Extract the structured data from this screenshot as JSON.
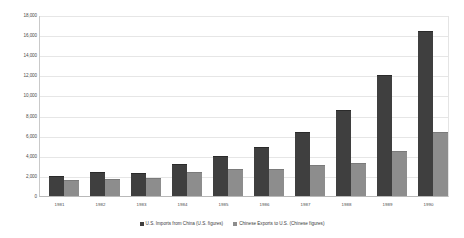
{
  "chart_data": {
    "type": "bar",
    "title": "",
    "subtitle": "",
    "xlabel": "",
    "ylabel": "",
    "ylim": [
      0,
      18000
    ],
    "ytick_step": 2000,
    "grid": true,
    "legend_position": "bottom",
    "categories": [
      "1981",
      "1982",
      "1983",
      "1984",
      "1985",
      "1986",
      "1987",
      "1988",
      "1989",
      "1990"
    ],
    "ytick_labels": [
      "18,000",
      "16,000",
      "14,000",
      "12,000",
      "10,000",
      "8,000",
      "6,000",
      "4,000",
      "2,000",
      "0"
    ],
    "ytick_values": [
      18000,
      16000,
      14000,
      12000,
      10000,
      8000,
      6000,
      4000,
      2000,
      0
    ],
    "series": [
      {
        "name": "U.S. Imports from China (U.S. figures)",
        "color": "#3f3f3f",
        "values": [
          1900,
          2300,
          2200,
          3100,
          3900,
          4800,
          6300,
          8500,
          11900,
          16300
        ]
      },
      {
        "name": "Chinese Exports to U.S. (Chinese figures)",
        "color": "#8d8d8d",
        "values": [
          1500,
          1600,
          1700,
          2300,
          2600,
          2600,
          3000,
          3200,
          4400,
          6300
        ]
      }
    ]
  }
}
